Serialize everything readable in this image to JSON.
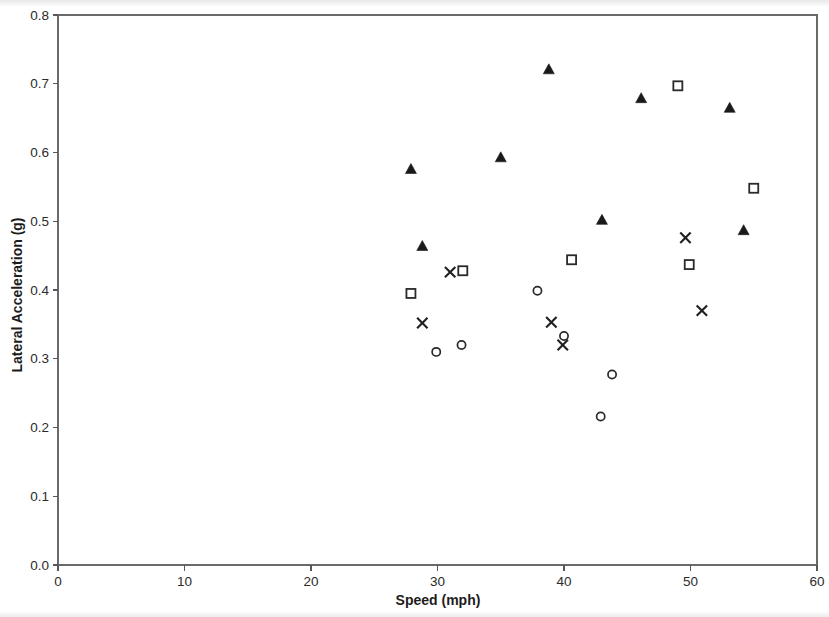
{
  "chart_data": {
    "type": "scatter",
    "title": "",
    "xlabel": "Speed (mph)",
    "ylabel": "Lateral Acceleration (g)",
    "xlim": [
      0,
      60
    ],
    "ylim": [
      0.0,
      0.8
    ],
    "xticks": [
      "0",
      "10",
      "20",
      "30",
      "40",
      "50",
      "60"
    ],
    "xtick_values": [
      0,
      10,
      20,
      30,
      40,
      50,
      60
    ],
    "yticks": [
      "0.0",
      "0.1",
      "0.2",
      "0.3",
      "0.4",
      "0.5",
      "0.6",
      "0.7",
      "0.8"
    ],
    "ytick_values": [
      0.0,
      0.1,
      0.2,
      0.3,
      0.4,
      0.5,
      0.6,
      0.7,
      0.8
    ],
    "grid": false,
    "legend": "none",
    "marker_color": "#1f1f1f",
    "axis_color": "#58585a",
    "series": [
      {
        "name": "series-triangle",
        "marker": "filled-triangle",
        "points": [
          [
            27.9,
            0.575
          ],
          [
            28.8,
            0.463
          ],
          [
            35.0,
            0.592
          ],
          [
            38.8,
            0.72
          ],
          [
            43.0,
            0.501
          ],
          [
            46.1,
            0.678
          ],
          [
            53.1,
            0.664
          ],
          [
            54.2,
            0.486
          ]
        ]
      },
      {
        "name": "series-square",
        "marker": "open-square",
        "points": [
          [
            27.9,
            0.395
          ],
          [
            32.0,
            0.428
          ],
          [
            40.6,
            0.444
          ],
          [
            49.0,
            0.697
          ],
          [
            49.9,
            0.437
          ],
          [
            55.0,
            0.548
          ]
        ]
      },
      {
        "name": "series-cross",
        "marker": "cross",
        "points": [
          [
            28.8,
            0.352
          ],
          [
            31.0,
            0.426
          ],
          [
            39.0,
            0.353
          ],
          [
            39.9,
            0.32
          ],
          [
            49.6,
            0.476
          ],
          [
            50.9,
            0.37
          ]
        ]
      },
      {
        "name": "series-circle",
        "marker": "open-circle",
        "points": [
          [
            29.9,
            0.31
          ],
          [
            31.9,
            0.32
          ],
          [
            37.9,
            0.399
          ],
          [
            40.0,
            0.333
          ],
          [
            43.8,
            0.277
          ],
          [
            42.9,
            0.216
          ]
        ]
      }
    ]
  },
  "axes": {
    "x_title": "Speed (mph)",
    "y_title": "Lateral Acceleration (g)"
  }
}
